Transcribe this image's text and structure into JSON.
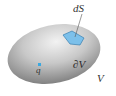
{
  "diagram": {
    "labels": {
      "surface_element": "dS",
      "boundary": "∂V",
      "volume": "V",
      "charge": "q"
    },
    "colors": {
      "body_light": "#e8e8e8",
      "body_dark": "#7a7a7a",
      "patch": "#7cc0ea",
      "patch_edge": "#3a7fb0",
      "charge": "#3aa8e0",
      "leader_line": "#555555"
    }
  }
}
